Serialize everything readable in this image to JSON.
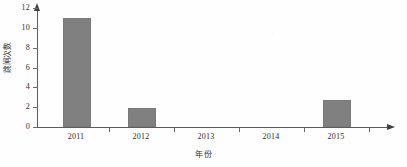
{
  "chart_data": {
    "type": "bar",
    "title": "",
    "subtitle": "",
    "categories": [
      "2011",
      "2012",
      "2013",
      "2014",
      "2015"
    ],
    "values": [
      11,
      1.9,
      0,
      0,
      2.7
    ],
    "series": [
      {
        "name": "跳闸次数",
        "values": [
          11,
          1.9,
          0,
          0,
          2.7
        ]
      }
    ],
    "xlabel": "年份",
    "ylabel": "跳闸次数",
    "ylim": [
      0,
      12
    ],
    "ytick_labels": [
      "0",
      "2",
      "4",
      "6",
      "8",
      "10",
      "12"
    ],
    "ytick_values": [
      0,
      2,
      4,
      6,
      8,
      10,
      12
    ],
    "xtick_labels": [
      "2011",
      "2012",
      "2013",
      "2014",
      "2015"
    ],
    "grid": false,
    "legend": false,
    "legend_position": "none",
    "bar_color": "#808080",
    "axis_color": "#5b5b5b",
    "text_color": "#2d2d2d",
    "annotations": []
  }
}
